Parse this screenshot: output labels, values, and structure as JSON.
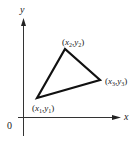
{
  "diagram": {
    "type": "coordinate-plane-triangle",
    "axes": {
      "x_label": "x",
      "y_label": "y",
      "origin_label": "0"
    },
    "vertices": [
      {
        "id": "v1",
        "label_x": "x",
        "sub_x": "1",
        "label_y": "y",
        "sub_y": "1",
        "text": "(x1,y1)"
      },
      {
        "id": "v2",
        "label_x": "x",
        "sub_x": "2",
        "label_y": "y",
        "sub_y": "2",
        "text": "(x2,y2)"
      },
      {
        "id": "v3",
        "label_x": "x",
        "sub_x": "3",
        "label_y": "y",
        "sub_y": "3",
        "text": "(x3,y3)"
      }
    ],
    "colors": {
      "stroke": "#111111",
      "axis": "#333333",
      "background": "#ffffff"
    }
  }
}
